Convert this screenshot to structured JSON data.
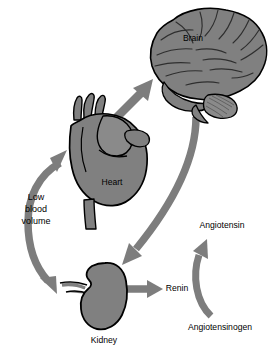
{
  "diagram": {
    "type": "physiological-pathway",
    "background_color": "#ffffff",
    "organ_fill_color": "#808080",
    "organ_stroke_color": "#000000",
    "arrow_color": "#7d7d7d",
    "text_color": "#000000",
    "organs": [
      {
        "id": "brain",
        "label": "Brain",
        "label_x": 193,
        "label_y": 41,
        "label_anchor": "middle",
        "label_on_shape": true
      },
      {
        "id": "heart",
        "label": "Heart",
        "label_x": 112,
        "label_y": 185,
        "label_anchor": "middle",
        "label_on_shape": true
      },
      {
        "id": "kidney",
        "label": "Kidney",
        "label_x": 104,
        "label_y": 343,
        "label_anchor": "middle",
        "label_on_shape": false
      }
    ],
    "labels": [
      {
        "id": "low-blood-volume",
        "lines": [
          "Low",
          "blood",
          "volume"
        ],
        "x": 36,
        "y": 212,
        "anchor": "middle"
      },
      {
        "id": "renin",
        "text": "Renin",
        "x": 177,
        "y": 291,
        "anchor": "middle"
      },
      {
        "id": "angiotensin",
        "text": "Angiotensin",
        "x": 222,
        "y": 228,
        "anchor": "middle"
      },
      {
        "id": "angiotensinogen",
        "text": "Angiotensinogen",
        "x": 220,
        "y": 330,
        "anchor": "middle"
      }
    ],
    "arrows": [
      {
        "id": "heart-to-brain",
        "from": "heart",
        "to": "brain",
        "style": "straight-diagonal"
      },
      {
        "id": "brain-to-kidney",
        "from": "brain",
        "to": "kidney",
        "style": "long-curve"
      },
      {
        "id": "kidney-to-renin",
        "from": "kidney",
        "to": "renin",
        "style": "straight-horizontal"
      },
      {
        "id": "angiotensinogen-to-angiotensin",
        "from": "angiotensinogen",
        "to": "angiotensin",
        "style": "curve-up"
      },
      {
        "id": "low-blood-volume-loop",
        "from": "kidney",
        "to": "heart",
        "style": "double-headed-c-curve"
      }
    ]
  }
}
